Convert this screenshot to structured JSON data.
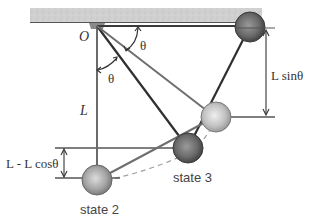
{
  "diagram": {
    "labels": {
      "pivot": "O",
      "theta_top": "θ",
      "theta_vertical": "θ",
      "length": "L",
      "height_drop": "L - L cosθ",
      "height_sin": "L sinθ",
      "state2": "state 2",
      "state3": "state 3"
    },
    "colors": {
      "ceiling": "#c8c8c8",
      "string_dark": "#2f2f2f",
      "string_light": "#6e6e6e",
      "ball_dark": "#6a6a6a",
      "ball_mid": "#9a9a9a",
      "ball_light": "#bdbdbd",
      "dashed_path": "#9a9a9a",
      "dimension": "#333333"
    }
  }
}
